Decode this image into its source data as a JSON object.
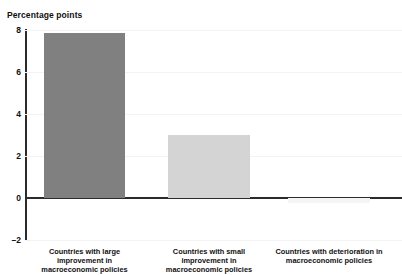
{
  "figure": {
    "truncated_header_text": "",
    "background_color": "#ffffff"
  },
  "chart_data": {
    "type": "bar",
    "title": "",
    "xlabel": "",
    "ylabel": "Percentage points",
    "ylim": [
      -2,
      8
    ],
    "yticks": [
      8,
      6,
      4,
      2,
      0,
      -2
    ],
    "ytick_labels": [
      "8",
      "6",
      "4",
      "2",
      "0",
      "–2"
    ],
    "grid": true,
    "grid_color": "#f3f3f5",
    "zero_line_color": "#2b2b2b",
    "legend": null,
    "categories": [
      "Countries with large improvement in macroeconomic policies",
      "Countries with small improvement in macroeconomic policies",
      "Countries with deterioration in macroeconomic policies"
    ],
    "category_lines": [
      [
        "Countries with large",
        "improvement in",
        "macroeconomic policies"
      ],
      [
        "Countries with small",
        "improvement in",
        "macroeconomic policies"
      ],
      [
        "Countries with deterioration in",
        "macroeconomic policies"
      ]
    ],
    "values": [
      7.85,
      3.0,
      -0.25
    ],
    "bar_colors": [
      "#808080",
      "#d4d4d4",
      "#f5f5f5"
    ],
    "series": [
      {
        "name": "Growth effect",
        "values": [
          7.85,
          3.0,
          -0.25
        ]
      }
    ]
  },
  "axis": {
    "title": "Percentage points"
  }
}
